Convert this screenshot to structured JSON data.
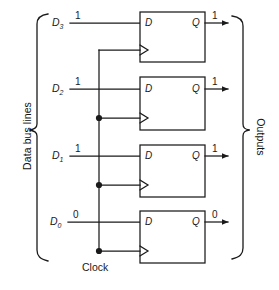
{
  "diagram": {
    "type": "digital-logic-schematic",
    "ink_color": "#1a1a1a",
    "background_color": "#ffffff",
    "left_group_label": "Data bus lines",
    "right_group_label": "Outputs",
    "clock_label": "Clock",
    "bit_rows": [
      {
        "id": "d3",
        "input_label": "D",
        "input_subscript": "3",
        "input_value": "1",
        "ff_d_pin": "D",
        "ff_q_pin": "Q",
        "output_value": "1"
      },
      {
        "id": "d2",
        "input_label": "D",
        "input_subscript": "2",
        "input_value": "1",
        "ff_d_pin": "D",
        "ff_q_pin": "Q",
        "output_value": "1"
      },
      {
        "id": "d1",
        "input_label": "D",
        "input_subscript": "1",
        "input_value": "1",
        "ff_d_pin": "D",
        "ff_q_pin": "Q",
        "output_value": "1"
      },
      {
        "id": "d0",
        "input_label": "D",
        "input_subscript": "0",
        "input_value": "0",
        "ff_d_pin": "D",
        "ff_q_pin": "Q",
        "output_value": "0"
      }
    ]
  }
}
